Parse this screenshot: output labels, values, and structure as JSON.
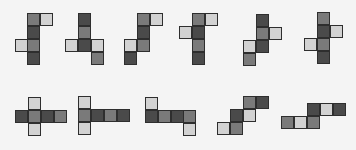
{
  "diagram": {
    "colors": {
      "D": "#4a4a4a",
      "M": "#7a7a7a",
      "L": "#d2d2d2",
      "border": "#2e2e2e",
      "background": "#f4f4f4"
    },
    "cell_size": 13,
    "nets": [
      {
        "id": 1,
        "cells": [
          [
            27,
            13,
            "M"
          ],
          [
            40,
            13,
            "L"
          ],
          [
            27,
            26,
            "D"
          ],
          [
            15,
            39,
            "L"
          ],
          [
            27,
            39,
            "M"
          ],
          [
            27,
            52,
            "D"
          ]
        ]
      },
      {
        "id": 2,
        "cells": [
          [
            78,
            13,
            "D"
          ],
          [
            78,
            26,
            "M"
          ],
          [
            65,
            39,
            "L"
          ],
          [
            78,
            39,
            "D"
          ],
          [
            91,
            39,
            "L"
          ],
          [
            91,
            52,
            "M"
          ]
        ]
      },
      {
        "id": 3,
        "cells": [
          [
            137,
            13,
            "M"
          ],
          [
            150,
            13,
            "L"
          ],
          [
            137,
            26,
            "D"
          ],
          [
            124,
            39,
            "L"
          ],
          [
            137,
            39,
            "M"
          ],
          [
            124,
            52,
            "D"
          ]
        ]
      },
      {
        "id": 4,
        "cells": [
          [
            192,
            13,
            "M"
          ],
          [
            205,
            13,
            "L"
          ],
          [
            179,
            26,
            "L"
          ],
          [
            192,
            26,
            "D"
          ],
          [
            192,
            39,
            "M"
          ],
          [
            192,
            52,
            "D"
          ]
        ]
      },
      {
        "id": 5,
        "cells": [
          [
            256,
            14,
            "D"
          ],
          [
            256,
            27,
            "M"
          ],
          [
            269,
            27,
            "L"
          ],
          [
            243,
            40,
            "L"
          ],
          [
            256,
            40,
            "D"
          ],
          [
            243,
            53,
            "M"
          ]
        ]
      },
      {
        "id": 6,
        "cells": [
          [
            317,
            12,
            "M"
          ],
          [
            317,
            25,
            "D"
          ],
          [
            330,
            25,
            "L"
          ],
          [
            304,
            38,
            "L"
          ],
          [
            317,
            38,
            "M"
          ],
          [
            317,
            51,
            "D"
          ]
        ]
      },
      {
        "id": 7,
        "cells": [
          [
            15,
            110,
            "D"
          ],
          [
            28,
            97,
            "L"
          ],
          [
            28,
            110,
            "M"
          ],
          [
            28,
            123,
            "L"
          ],
          [
            41,
            110,
            "D"
          ],
          [
            54,
            110,
            "M"
          ]
        ]
      },
      {
        "id": 8,
        "cells": [
          [
            78,
            96,
            "L"
          ],
          [
            78,
            109,
            "M"
          ],
          [
            78,
            122,
            "L"
          ],
          [
            91,
            109,
            "D"
          ],
          [
            104,
            109,
            "M"
          ],
          [
            117,
            109,
            "D"
          ]
        ]
      },
      {
        "id": 9,
        "cells": [
          [
            145,
            97,
            "L"
          ],
          [
            145,
            110,
            "D"
          ],
          [
            158,
            110,
            "M"
          ],
          [
            171,
            110,
            "D"
          ],
          [
            183,
            110,
            "M"
          ],
          [
            183,
            123,
            "L"
          ]
        ]
      },
      {
        "id": 10,
        "cells": [
          [
            243,
            96,
            "M"
          ],
          [
            256,
            96,
            "D"
          ],
          [
            230,
            109,
            "D"
          ],
          [
            243,
            109,
            "L"
          ],
          [
            217,
            122,
            "L"
          ],
          [
            230,
            122,
            "M"
          ]
        ]
      },
      {
        "id": 11,
        "cells": [
          [
            307,
            103,
            "D"
          ],
          [
            320,
            103,
            "L"
          ],
          [
            333,
            103,
            "D"
          ],
          [
            281,
            116,
            "M"
          ],
          [
            294,
            116,
            "L"
          ],
          [
            307,
            116,
            "M"
          ]
        ]
      }
    ]
  }
}
